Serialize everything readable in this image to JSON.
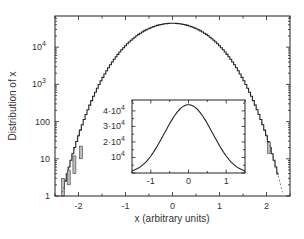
{
  "chart_data": [
    {
      "id": "main",
      "type": "line",
      "title": "",
      "xlabel": "x (arbitrary units)",
      "ylabel": "Distribution of x",
      "yscale": "log",
      "xlim": [
        -2.5,
        2.5
      ],
      "ylim": [
        1,
        80000
      ],
      "grid": false,
      "xticks": [
        -2,
        -1,
        0,
        1,
        2
      ],
      "xtick_labels": [
        "-2",
        "-1",
        "0",
        "1",
        "2"
      ],
      "yticks": [
        1,
        10,
        100,
        1000,
        10000
      ],
      "ytick_labels": [
        "1",
        "10",
        "100",
        "10^3",
        "10^4"
      ],
      "series": [
        {
          "name": "histogram",
          "style": "step",
          "x": [
            -2.5,
            -2.25,
            -2.0,
            -1.75,
            -1.5,
            -1.25,
            -1.0,
            -0.75,
            -0.5,
            -0.25,
            0,
            0.25,
            0.5,
            0.75,
            1.0,
            1.25,
            1.5,
            1.75,
            2.0,
            2.25,
            2.5
          ],
          "values": [
            0.16,
            3.5,
            41.8,
            298,
            1389,
            4530,
            10960,
            20730,
            31780,
            40620,
            44000,
            40620,
            31780,
            20730,
            10960,
            4530,
            1389,
            298,
            41.8,
            3.5,
            0.16
          ]
        },
        {
          "name": "fit",
          "style": "dashed",
          "x": [
            -2.5,
            -2.25,
            -2.0,
            2.0,
            2.25,
            2.5
          ],
          "values": [
            0.16,
            3.5,
            41.8,
            41.8,
            3.5,
            0.16
          ]
        }
      ]
    },
    {
      "id": "inset",
      "type": "line",
      "title": "",
      "xlabel": "",
      "ylabel": "",
      "yscale": "linear",
      "xlim": [
        -1.5,
        1.5
      ],
      "ylim": [
        0,
        47000
      ],
      "grid": false,
      "xticks": [
        -1,
        0,
        1
      ],
      "xtick_labels": [
        "-1",
        "0",
        "1"
      ],
      "yticks": [
        10000,
        20000,
        30000,
        40000
      ],
      "ytick_labels": [
        "10^4",
        "2·10^4",
        "3·10^4",
        "4·10^4"
      ],
      "series": [
        {
          "name": "distribution (linear)",
          "style": "solid",
          "x": [
            -1.5,
            -1.25,
            -1.0,
            -0.75,
            -0.5,
            -0.25,
            0,
            0.25,
            0.5,
            0.75,
            1.0,
            1.25,
            1.5
          ],
          "values": [
            1389,
            4530,
            10960,
            20730,
            31780,
            40620,
            44000,
            40620,
            31780,
            20730,
            10960,
            4530,
            1389
          ]
        }
      ]
    }
  ],
  "model": {
    "peak": 44000,
    "a": 1.273,
    "b": 0.1167
  }
}
